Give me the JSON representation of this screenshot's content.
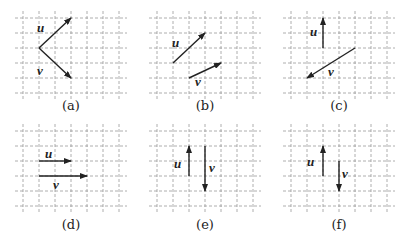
{
  "colors": {
    "grid": "#9a9a9a",
    "vector": "#222222",
    "text": "#222222"
  },
  "grid": {
    "cols": 6,
    "rows": 5,
    "cell_w": 16,
    "cell_h": 15
  },
  "panels": [
    {
      "id": "a",
      "caption": "(a)",
      "left": 0,
      "top": 0,
      "vectors": [
        {
          "name": "u",
          "label": "u",
          "from": [
            1,
            2
          ],
          "to": [
            3,
            0
          ],
          "label_pos": [
            37,
            32
          ]
        },
        {
          "name": "v",
          "label": "v",
          "from": [
            1,
            2
          ],
          "to": [
            3,
            4
          ],
          "label_pos": [
            37,
            75
          ]
        }
      ]
    },
    {
      "id": "b",
      "caption": "(b)",
      "left": 134,
      "top": 0,
      "vectors": [
        {
          "name": "u",
          "label": "u",
          "from": [
            1,
            3
          ],
          "to": [
            3,
            1
          ],
          "label_pos": [
            38,
            47
          ]
        },
        {
          "name": "v",
          "label": "v",
          "from": [
            2,
            4
          ],
          "to": [
            4,
            3
          ],
          "label_pos": [
            61,
            86
          ]
        }
      ]
    },
    {
      "id": "c",
      "caption": "(c)",
      "left": 268,
      "top": 0,
      "vectors": [
        {
          "name": "u",
          "label": "u",
          "from": [
            2,
            2
          ],
          "to": [
            2,
            0
          ],
          "label_pos": [
            42,
            36
          ]
        },
        {
          "name": "v",
          "label": "v",
          "from": [
            4,
            2
          ],
          "to": [
            1,
            4
          ],
          "label_pos": [
            60,
            76
          ]
        }
      ]
    },
    {
      "id": "d",
      "caption": "(d)",
      "left": 0,
      "top": 121,
      "vectors": [
        {
          "name": "u",
          "label": "u",
          "from": [
            1,
            2
          ],
          "to": [
            3,
            2
          ],
          "label_pos": [
            45,
            37
          ]
        },
        {
          "name": "v",
          "label": "v",
          "from": [
            1,
            3
          ],
          "to": [
            4,
            3
          ],
          "label_pos": [
            53,
            68
          ]
        }
      ]
    },
    {
      "id": "e",
      "caption": "(e)",
      "left": 134,
      "top": 121,
      "vectors": [
        {
          "name": "u",
          "label": "u",
          "from": [
            2,
            3
          ],
          "to": [
            2,
            1
          ],
          "label_pos": [
            40,
            47
          ]
        },
        {
          "name": "v",
          "label": "v",
          "from": [
            3,
            1
          ],
          "to": [
            3,
            4
          ],
          "label_pos": [
            75,
            51
          ]
        }
      ]
    },
    {
      "id": "f",
      "caption": "(f)",
      "left": 268,
      "top": 121,
      "vectors": [
        {
          "name": "u",
          "label": "u",
          "from": [
            2,
            3
          ],
          "to": [
            2,
            1
          ],
          "label_pos": [
            39,
            45
          ]
        },
        {
          "name": "v",
          "label": "v",
          "from": [
            3,
            2
          ],
          "to": [
            3,
            4
          ],
          "label_pos": [
            74,
            57
          ]
        }
      ]
    }
  ]
}
